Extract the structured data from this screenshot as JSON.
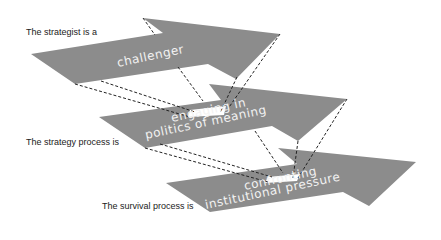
{
  "labels": {
    "strategist": "The strategist is a",
    "strategy_process": "The strategy process is",
    "survival_process": "The survival process is"
  },
  "arrows": [
    {
      "id": "challenger",
      "line1": "challenger",
      "line2": ""
    },
    {
      "id": "politics",
      "line1": "engaging in",
      "line2": "politics of meaning"
    },
    {
      "id": "pressure",
      "line1": "confronting",
      "line2": "institutional pressure"
    }
  ],
  "colors": {
    "arrow_fill": "#8c8c8c",
    "text": "#f2f2f2",
    "dash": "#222222"
  }
}
